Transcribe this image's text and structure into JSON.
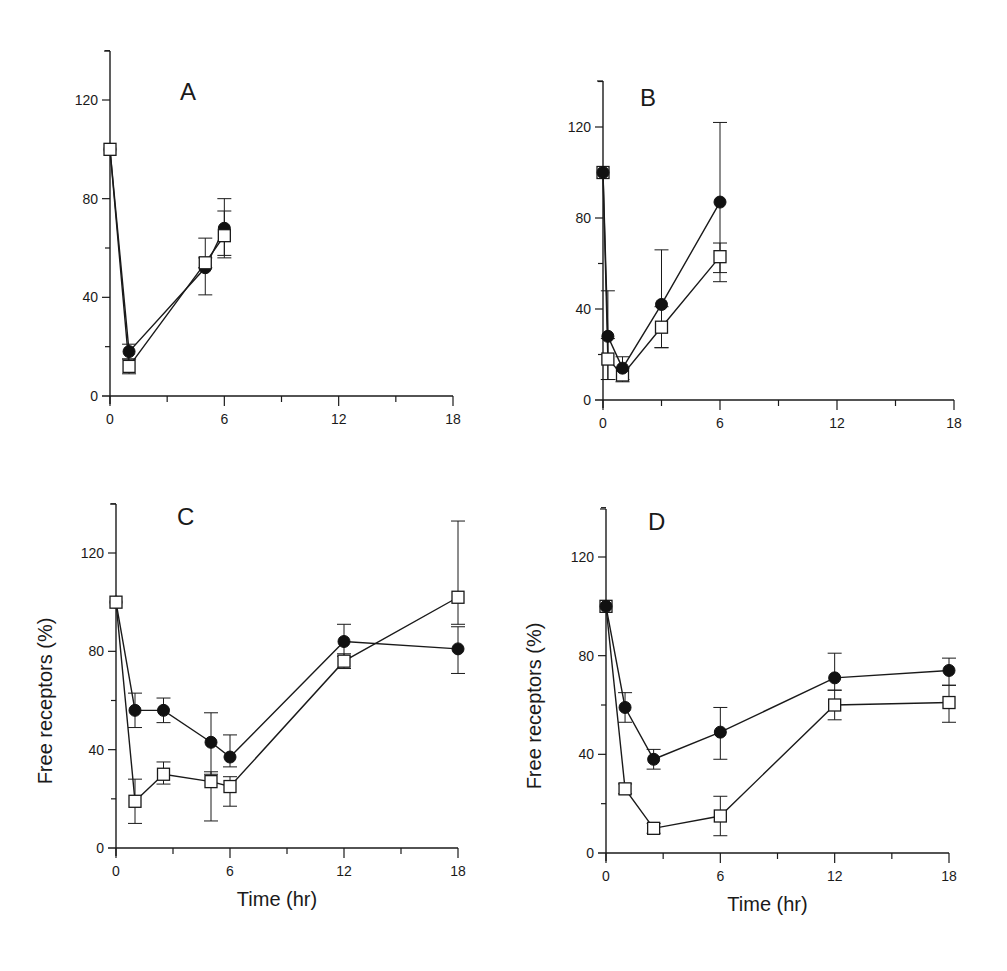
{
  "chart_data": [
    {
      "type": "line",
      "panel": "A",
      "title": "A",
      "xlabel": "",
      "ylabel": "",
      "xlim": [
        0,
        18
      ],
      "ylim": [
        0,
        140
      ],
      "xticks": [
        0,
        6,
        12,
        18
      ],
      "yticks": [
        0,
        40,
        80,
        120
      ],
      "series": [
        {
          "name": "filled-circle",
          "marker": "filled-circle",
          "x": [
            0,
            1,
            5,
            6
          ],
          "y": [
            100,
            18,
            52,
            68
          ],
          "err_low": [
            0,
            3,
            11,
            12
          ],
          "err_high": [
            0,
            3,
            12,
            12
          ]
        },
        {
          "name": "open-square",
          "marker": "open-square",
          "x": [
            0,
            1,
            5,
            6
          ],
          "y": [
            100,
            12,
            54,
            65
          ],
          "err_low": [
            0,
            3,
            2,
            8
          ],
          "err_high": [
            0,
            3,
            2,
            10
          ]
        }
      ]
    },
    {
      "type": "line",
      "panel": "B",
      "title": "B",
      "xlabel": "",
      "ylabel": "",
      "xlim": [
        0,
        18
      ],
      "ylim": [
        0,
        140
      ],
      "xticks": [
        0,
        6,
        12,
        18
      ],
      "yticks": [
        0,
        40,
        80,
        120
      ],
      "series": [
        {
          "name": "filled-circle",
          "marker": "filled-circle",
          "x": [
            0,
            0.25,
            1,
            3,
            6
          ],
          "y": [
            100,
            28,
            14,
            42,
            87
          ],
          "err_low": [
            0,
            19,
            5,
            19,
            35
          ],
          "err_high": [
            0,
            20,
            5,
            24,
            35
          ]
        },
        {
          "name": "open-square",
          "marker": "open-square",
          "x": [
            0,
            0.25,
            1,
            3,
            6
          ],
          "y": [
            100,
            18,
            11,
            32,
            63
          ],
          "err_low": [
            0,
            9,
            3,
            9,
            7
          ],
          "err_high": [
            0,
            9,
            3,
            9,
            6
          ]
        }
      ]
    },
    {
      "type": "line",
      "panel": "C",
      "title": "C",
      "xlabel": "Time (hr)",
      "ylabel": "Free receptors (%)",
      "xlim": [
        0,
        18
      ],
      "ylim": [
        0,
        140
      ],
      "xticks": [
        0,
        6,
        12,
        18
      ],
      "yticks": [
        0,
        40,
        80,
        120
      ],
      "series": [
        {
          "name": "filled-circle",
          "marker": "filled-circle",
          "x": [
            0,
            1,
            2.5,
            5,
            6,
            12,
            18
          ],
          "y": [
            100,
            56,
            56,
            43,
            37,
            84,
            81
          ],
          "err_low": [
            0,
            7,
            5,
            13,
            4,
            6,
            10
          ],
          "err_high": [
            0,
            7,
            5,
            12,
            9,
            7,
            9
          ]
        },
        {
          "name": "open-square",
          "marker": "open-square",
          "x": [
            0,
            1,
            2.5,
            5,
            6,
            12,
            18
          ],
          "y": [
            100,
            19,
            30,
            27,
            25,
            76,
            102
          ],
          "err_low": [
            0,
            9,
            4,
            16,
            8,
            3,
            11
          ],
          "err_high": [
            0,
            9,
            5,
            4,
            4,
            3,
            31
          ]
        }
      ]
    },
    {
      "type": "line",
      "panel": "D",
      "title": "D",
      "xlabel": "Time (hr)",
      "ylabel": "Free receptors (%)",
      "xlim": [
        0,
        18
      ],
      "ylim": [
        0,
        140
      ],
      "xticks": [
        0,
        6,
        12,
        18
      ],
      "yticks": [
        0,
        40,
        80,
        120
      ],
      "series": [
        {
          "name": "filled-circle",
          "marker": "filled-circle",
          "x": [
            0,
            1,
            2.5,
            6,
            12,
            18
          ],
          "y": [
            100,
            59,
            38,
            49,
            71,
            74
          ],
          "err_low": [
            0,
            6,
            4,
            11,
            5,
            6
          ],
          "err_high": [
            0,
            6,
            4,
            10,
            10,
            5
          ]
        },
        {
          "name": "open-square",
          "marker": "open-square",
          "x": [
            0,
            1,
            2.5,
            6,
            12,
            18
          ],
          "y": [
            100,
            26,
            10,
            15,
            60,
            61
          ],
          "err_low": [
            0,
            2,
            2,
            8,
            6,
            8
          ],
          "err_high": [
            0,
            2,
            2,
            8,
            6,
            7
          ]
        }
      ]
    }
  ]
}
